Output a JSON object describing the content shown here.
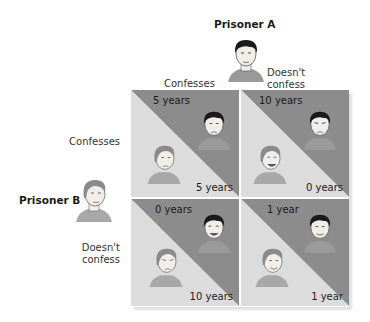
{
  "prisoner_a": {
    "title": "Prisoner A",
    "strategies": [
      "Confesses",
      "Doesn't confess"
    ]
  },
  "prisoner_b": {
    "title": "Prisoner B",
    "strategies": [
      "Confesses",
      "Doesn't confess"
    ]
  },
  "matrix": {
    "cells": [
      {
        "row": "Confesses",
        "col": "Confesses",
        "a_sentence": "5 years",
        "b_sentence": "5 years",
        "a_mood": "worried",
        "b_mood": "worried"
      },
      {
        "row": "Confesses",
        "col": "Doesn't confess",
        "a_sentence": "10 years",
        "b_sentence": "0 years",
        "a_mood": "worried",
        "b_mood": "happy"
      },
      {
        "row": "Doesn't confess",
        "col": "Confesses",
        "a_sentence": "0 years",
        "b_sentence": "10 years",
        "a_mood": "happy",
        "b_mood": "worried"
      },
      {
        "row": "Doesn't confess",
        "col": "Doesn't confess",
        "a_sentence": "1 year",
        "b_sentence": "1 year",
        "a_mood": "content",
        "b_mood": "content"
      }
    ]
  },
  "colors": {
    "a_triangle": "#8c8c8c",
    "b_triangle": "#dcdcdc",
    "divider": "#f2f2f2",
    "skin": "#f1eee9",
    "shirt": "#9a9a9a",
    "hair_a": "#1a1a1a",
    "hair_b": "#7a7a7a"
  }
}
